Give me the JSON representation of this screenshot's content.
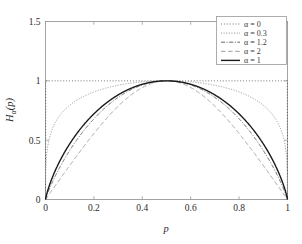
{
  "figure": {
    "title": "",
    "background_color": "#ffffff",
    "frame_color": "#9a9a9a"
  },
  "axes": {
    "x_title": "p",
    "y_title": "H",
    "y_title_sub": "α",
    "y_title_arg": "(p)",
    "x_ticks": [
      "0",
      "0.2",
      "0.4",
      "0.6",
      "0.8",
      "1"
    ],
    "y_ticks": [
      "0",
      "0.5",
      "1",
      "1.5"
    ],
    "xlim": [
      0,
      1
    ],
    "ylim": [
      0,
      1.5
    ]
  },
  "legend": {
    "position": "top-right",
    "entries": [
      {
        "label": "α = 0",
        "style": "dotted-fine",
        "color": "#4d4d4d",
        "width": 0.9
      },
      {
        "label": "α = 0.3",
        "style": "dotted",
        "color": "#8a8a8a",
        "width": 0.9
      },
      {
        "label": "α = 1.2",
        "style": "dashdot",
        "color": "#555555",
        "width": 0.9
      },
      {
        "label": "α = 2",
        "style": "dashed",
        "color": "#9e9e9e",
        "width": 1.0
      },
      {
        "label": "α = 1",
        "style": "solid",
        "color": "#1a1a1a",
        "width": 1.4
      }
    ]
  },
  "chart_data": {
    "type": "line",
    "title": "",
    "xlabel": "p",
    "ylabel": "H_alpha(p)",
    "xlim": [
      0,
      1
    ],
    "ylim": [
      0,
      1.5
    ],
    "grid": false,
    "legend_position": "upper right",
    "x_ticks": [
      0,
      0.2,
      0.4,
      0.6,
      0.8,
      1
    ],
    "y_ticks": [
      0,
      0.5,
      1,
      1.5
    ],
    "x": [
      0,
      0.02,
      0.05,
      0.1,
      0.15,
      0.2,
      0.25,
      0.3,
      0.35,
      0.4,
      0.45,
      0.5,
      0.55,
      0.6,
      0.65,
      0.7,
      0.75,
      0.8,
      0.85,
      0.9,
      0.95,
      0.98,
      1
    ],
    "series": [
      {
        "name": "α = 0",
        "alpha": 0,
        "style": "dotted-fine",
        "color": "#4d4d4d",
        "peak": 1.0,
        "values": [
          0,
          1,
          1,
          1,
          1,
          1,
          1,
          1,
          1,
          1,
          1,
          1,
          1,
          1,
          1,
          1,
          1,
          1,
          1,
          1,
          1,
          1,
          0
        ]
      },
      {
        "name": "α = 0.3",
        "alpha": 0.3,
        "style": "dotted",
        "color": "#8a8a8a",
        "peak": 0.894,
        "values": [
          0,
          0.396,
          0.531,
          0.641,
          0.707,
          0.754,
          0.79,
          0.818,
          0.841,
          0.859,
          0.873,
          0.879,
          0.873,
          0.859,
          0.841,
          0.818,
          0.79,
          0.754,
          0.707,
          0.641,
          0.531,
          0.396,
          0
        ]
      },
      {
        "name": "α = 1.2",
        "alpha": 1.2,
        "style": "dashdot",
        "color": "#555555",
        "peak": 0.65,
        "values": [
          0,
          0.059,
          0.124,
          0.216,
          0.288,
          0.349,
          0.401,
          0.447,
          0.487,
          0.52,
          0.546,
          0.562,
          0.546,
          0.52,
          0.487,
          0.447,
          0.401,
          0.349,
          0.288,
          0.216,
          0.124,
          0.059,
          0
        ]
      },
      {
        "name": "α = 2",
        "alpha": 2,
        "style": "dashed",
        "color": "#9e9e9e",
        "peak": 0.5,
        "values": [
          0,
          0.057,
          0.138,
          0.248,
          0.333,
          0.401,
          0.456,
          0.501,
          0.538,
          0.566,
          0.586,
          0.593,
          0.586,
          0.566,
          0.538,
          0.501,
          0.456,
          0.401,
          0.333,
          0.248,
          0.138,
          0.057,
          0
        ]
      },
      {
        "name": "α = 1",
        "alpha": 1,
        "style": "solid",
        "color": "#1a1a1a",
        "peak": 1.0,
        "values": [
          0,
          0.141,
          0.286,
          0.469,
          0.61,
          0.722,
          0.811,
          0.881,
          0.934,
          0.971,
          0.993,
          1.0,
          0.993,
          0.971,
          0.934,
          0.881,
          0.811,
          0.722,
          0.61,
          0.469,
          0.286,
          0.141,
          0
        ]
      }
    ]
  }
}
